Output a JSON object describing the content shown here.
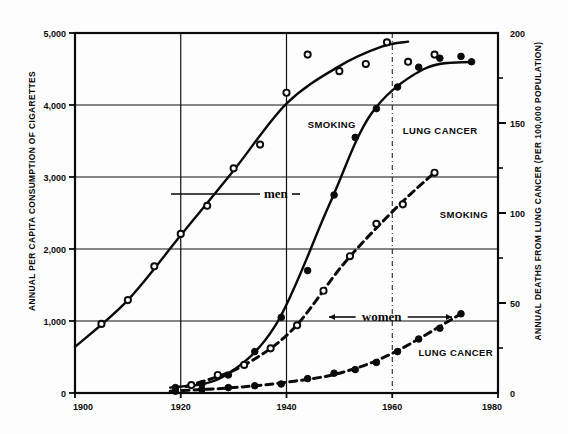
{
  "chart_data": {
    "type": "line",
    "title": "",
    "xlabel": "",
    "ylabel": "ANNUAL PER CAPITA CONSUMPTION OF CIGARETTES",
    "ylabel_right": "ANNUAL DEATHS FROM LUNG CANCER (PER 100,000 POPULATION)",
    "xlim": [
      1900,
      1980
    ],
    "ylim": [
      0,
      5000
    ],
    "ylim_right": [
      0,
      200
    ],
    "xticks": [
      "1900",
      "1920",
      "1940",
      "1960",
      "1980"
    ],
    "xtick_values": [
      1900,
      1920,
      1940,
      1960,
      1980
    ],
    "yticks_left": [
      "0",
      "1,000",
      "2,000",
      "3,000",
      "4,000",
      "5,000"
    ],
    "ytick_values_left": [
      0,
      1000,
      2000,
      3000,
      4000,
      5000
    ],
    "yticks_right": [
      "0",
      "50",
      "100",
      "150",
      "200"
    ],
    "ytick_values_right": [
      0,
      50,
      100,
      150,
      200
    ],
    "yticks_right_minor": [
      25,
      75,
      125,
      175
    ],
    "grid": true,
    "legend_position": "inline-annotations",
    "series": [
      {
        "name": "SMOKING",
        "group": "men",
        "axis": "left",
        "marker": "open-circle",
        "line": "solid",
        "points": [
          {
            "x": 1905,
            "y": 960
          },
          {
            "x": 1910,
            "y": 1290
          },
          {
            "x": 1915,
            "y": 1760
          },
          {
            "x": 1920,
            "y": 2210
          },
          {
            "x": 1925,
            "y": 2600
          },
          {
            "x": 1930,
            "y": 3120
          },
          {
            "x": 1935,
            "y": 3450
          },
          {
            "x": 1940,
            "y": 4170
          },
          {
            "x": 1944,
            "y": 4700
          },
          {
            "x": 1950,
            "y": 4470
          },
          {
            "x": 1955,
            "y": 4570
          },
          {
            "x": 1959,
            "y": 4870
          },
          {
            "x": 1963,
            "y": 4600
          },
          {
            "x": 1968,
            "y": 4700
          }
        ],
        "curve": [
          {
            "x": 1900,
            "y": 640
          },
          {
            "x": 1910,
            "y": 1290
          },
          {
            "x": 1920,
            "y": 2190
          },
          {
            "x": 1930,
            "y": 3090
          },
          {
            "x": 1940,
            "y": 4020
          },
          {
            "x": 1950,
            "y": 4540
          },
          {
            "x": 1958,
            "y": 4810
          },
          {
            "x": 1963,
            "y": 4880
          }
        ]
      },
      {
        "name": "LUNG CANCER",
        "group": "men",
        "axis": "right",
        "marker": "filled-circle",
        "line": "solid",
        "points": [
          {
            "x": 1919,
            "y": 3
          },
          {
            "x": 1924,
            "y": 5
          },
          {
            "x": 1929,
            "y": 10
          },
          {
            "x": 1934,
            "y": 23
          },
          {
            "x": 1939,
            "y": 42
          },
          {
            "x": 1944,
            "y": 68
          },
          {
            "x": 1949,
            "y": 110
          },
          {
            "x": 1953,
            "y": 142
          },
          {
            "x": 1957,
            "y": 158
          },
          {
            "x": 1961,
            "y": 170
          },
          {
            "x": 1965,
            "y": 181
          },
          {
            "x": 1969,
            "y": 186
          },
          {
            "x": 1973,
            "y": 187
          },
          {
            "x": 1975,
            "y": 184
          }
        ],
        "curve": [
          {
            "x": 1918,
            "y": 3
          },
          {
            "x": 1928,
            "y": 9
          },
          {
            "x": 1938,
            "y": 38
          },
          {
            "x": 1948,
            "y": 104
          },
          {
            "x": 1956,
            "y": 155
          },
          {
            "x": 1966,
            "y": 180
          },
          {
            "x": 1975,
            "y": 184
          }
        ]
      },
      {
        "name": "SMOKING",
        "group": "women",
        "axis": "left",
        "marker": "open-circle",
        "line": "dashed",
        "points": [
          {
            "x": 1922,
            "y": 110
          },
          {
            "x": 1927,
            "y": 250
          },
          {
            "x": 1932,
            "y": 390
          },
          {
            "x": 1937,
            "y": 620
          },
          {
            "x": 1942,
            "y": 940
          },
          {
            "x": 1947,
            "y": 1420
          },
          {
            "x": 1952,
            "y": 1900
          },
          {
            "x": 1957,
            "y": 2350
          },
          {
            "x": 1962,
            "y": 2620
          },
          {
            "x": 1968,
            "y": 3060
          }
        ],
        "curve": [
          {
            "x": 1921,
            "y": 90
          },
          {
            "x": 1931,
            "y": 350
          },
          {
            "x": 1941,
            "y": 870
          },
          {
            "x": 1951,
            "y": 1810
          },
          {
            "x": 1961,
            "y": 2590
          },
          {
            "x": 1968,
            "y": 3060
          }
        ]
      },
      {
        "name": "LUNG CANCER",
        "group": "women",
        "axis": "right",
        "marker": "filled-circle",
        "line": "dashed",
        "points": [
          {
            "x": 1919,
            "y": 1
          },
          {
            "x": 1924,
            "y": 2
          },
          {
            "x": 1929,
            "y": 3
          },
          {
            "x": 1934,
            "y": 4
          },
          {
            "x": 1939,
            "y": 5
          },
          {
            "x": 1944,
            "y": 8
          },
          {
            "x": 1949,
            "y": 11
          },
          {
            "x": 1953,
            "y": 13
          },
          {
            "x": 1957,
            "y": 17
          },
          {
            "x": 1961,
            "y": 23
          },
          {
            "x": 1965,
            "y": 30
          },
          {
            "x": 1969,
            "y": 36
          },
          {
            "x": 1973,
            "y": 44
          }
        ],
        "curve": [
          {
            "x": 1918,
            "y": 1
          },
          {
            "x": 1930,
            "y": 3
          },
          {
            "x": 1940,
            "y": 6
          },
          {
            "x": 1950,
            "y": 11
          },
          {
            "x": 1960,
            "y": 22
          },
          {
            "x": 1973,
            "y": 44
          }
        ]
      }
    ],
    "annotations": [
      {
        "id": "smoking-men-label",
        "text": "SMOKING",
        "x": 1944,
        "y_px": 128
      },
      {
        "id": "lung-cancer-men-label",
        "text": "LUNG CANCER",
        "x": 1962,
        "y_px": 134
      },
      {
        "id": "smoking-women-label",
        "text": "SMOKING",
        "x": 1969,
        "y_px": 218
      },
      {
        "id": "lung-cancer-women-label",
        "text": "LUNG CANCER",
        "x": 1972,
        "y_px": 356
      },
      {
        "id": "men-bracket-label",
        "text": "men",
        "x": 1938,
        "y_px": 194
      },
      {
        "id": "women-bracket-label",
        "text": "women",
        "x": 1958,
        "y_px": 317
      }
    ]
  }
}
